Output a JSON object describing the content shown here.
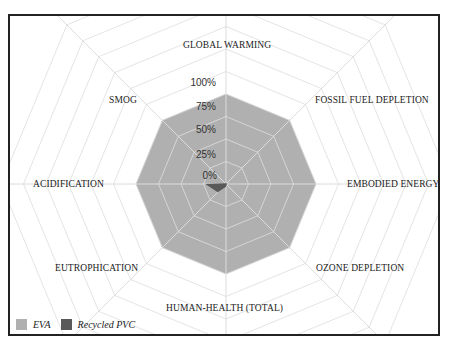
{
  "chart_data": {
    "type": "radar",
    "title": "",
    "categories": [
      "GLOBAL WARMING",
      "FOSSIL FUEL DEPLETION",
      "EMBODIED ENERGY",
      "OZONE DEPLETION",
      "HUMAN-HEALTH (TOTAL)",
      "EUTROPHICATION",
      "ACIDIFICATION",
      "SMOG"
    ],
    "series": [
      {
        "name": "EVA",
        "color": "#b0b0b0",
        "values": [
          100,
          100,
          100,
          100,
          100,
          100,
          100,
          100
        ]
      },
      {
        "name": "Recycled PVC",
        "color": "#595959",
        "values": [
          1,
          1,
          1,
          1,
          3,
          13,
          23,
          1
        ]
      }
    ],
    "radial_ticks": [
      "0%",
      "25%",
      "50%",
      "75%",
      "100%"
    ],
    "rlim": [
      0,
      100
    ],
    "grid": true,
    "legend_position": "bottom-left"
  },
  "labels": {
    "global_warming": "GLOBAL WARMING",
    "fossil_fuel": "FOSSIL FUEL DEPLETION",
    "embodied_energy": "EMBODIED ENERGY",
    "ozone": "OZONE DEPLETION",
    "human_health": "HUMAN-HEALTH (TOTAL)",
    "eutrophication": "EUTROPHICATION",
    "acidification": "ACIDIFICATION",
    "smog": "SMOG"
  },
  "ticks": {
    "t0": "0%",
    "t25": "25%",
    "t50": "50%",
    "t75": "75%",
    "t100": "100%"
  },
  "legend": {
    "eva": "EVA",
    "pvc": "Recycled PVC"
  }
}
